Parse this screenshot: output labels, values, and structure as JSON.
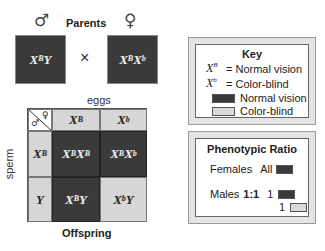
{
  "parents": {
    "title": "Parents",
    "male_symbol": "♂",
    "female_symbol": "♀",
    "cross_symbol": "×",
    "male": {
      "base1": "X",
      "sup1": "B",
      "base2": "Y",
      "sup2": ""
    },
    "female": {
      "base1": "X",
      "sup1": "B",
      "base2": "X",
      "sup2": "b"
    }
  },
  "punnett": {
    "top_label": "eggs",
    "side_label": "sperm",
    "bottom_label": "Offspring",
    "corner_male": "♂",
    "corner_female": "♀",
    "columns": [
      {
        "base": "X",
        "sup": "B"
      },
      {
        "base": "X",
        "sup": "b"
      }
    ],
    "rows": [
      {
        "base": "X",
        "sup": "B"
      },
      {
        "base": "Y",
        "sup": ""
      }
    ],
    "cells": [
      [
        {
          "b1": "X",
          "s1": "B",
          "b2": "X",
          "s2": "B",
          "phenotype": "dark"
        },
        {
          "b1": "X",
          "s1": "B",
          "b2": "X",
          "s2": "b",
          "phenotype": "dark"
        }
      ],
      [
        {
          "b1": "X",
          "s1": "B",
          "b2": "Y",
          "s2": "",
          "phenotype": "dark"
        },
        {
          "b1": "X",
          "s1": "b",
          "b2": "Y",
          "s2": "",
          "phenotype": "light"
        }
      ]
    ]
  },
  "key": {
    "title": "Key",
    "items": [
      {
        "base": "X",
        "sup": "B",
        "text": "= Normal vision"
      },
      {
        "base": "X",
        "sup": "b",
        "text": "= Color-blind"
      }
    ],
    "swatches": [
      {
        "type": "dark",
        "label": "Normal vision"
      },
      {
        "type": "light",
        "label": "Color-blind"
      }
    ]
  },
  "ratio": {
    "title": "Phenotypic Ratio",
    "females_label": "Females",
    "females_value": "All",
    "males_label": "Males",
    "males_ratio": "1:1",
    "males_count_1": "1",
    "males_count_2": "1"
  },
  "colors": {
    "dark": "#3a3a3a",
    "light": "#d6d6d6",
    "frame": "#e4e4e4"
  }
}
